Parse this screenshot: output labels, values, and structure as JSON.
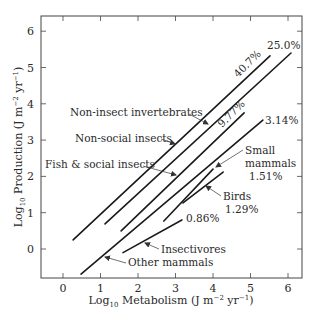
{
  "chart_data": {
    "type": "line",
    "title": "",
    "xlabel": "Log10 Metabolism (J m^-2 yr^-1)",
    "ylabel": "Log10 Production (J m^-2 yr^-1)",
    "xlabel_parts": {
      "log": "Log",
      "sub": "10",
      "main": " Metabolism (J m",
      "exp1": "−2",
      "mid": " yr",
      "exp2": "−1",
      "end": ")"
    },
    "ylabel_parts": {
      "log": "Log",
      "sub": "10",
      "main": " Production (J m",
      "exp1": "−2",
      "mid": " yr",
      "exp2": "−1",
      "end": ")"
    },
    "xlim": [
      -0.6,
      6.3
    ],
    "ylim": [
      -0.8,
      6.4
    ],
    "xticks": [
      0,
      1,
      2,
      3,
      4,
      5,
      6
    ],
    "yticks": [
      0,
      1,
      2,
      3,
      4,
      5,
      6
    ],
    "grid": false,
    "legend": "none (direct labels)",
    "series": [
      {
        "name": "Non-social insects",
        "efficiency": "40.7%",
        "x": [
          0.27,
          5.52
        ],
        "y": [
          0.25,
          5.32
        ]
      },
      {
        "name": "Non-insect invertebrates",
        "efficiency": "25.0%",
        "x": [
          1.12,
          6.08
        ],
        "y": [
          0.69,
          5.4
        ]
      },
      {
        "name": "Fish & social insects",
        "efficiency": "9.77%",
        "x": [
          1.55,
          4.83
        ],
        "y": [
          0.5,
          3.75
        ]
      },
      {
        "name": "Other mammals",
        "efficiency": "3.14%",
        "x": [
          0.48,
          5.33
        ],
        "y": [
          -0.69,
          3.55
        ]
      },
      {
        "name": "Small mammals",
        "efficiency": "1.51%",
        "x": [
          2.69,
          4.0
        ],
        "y": [
          0.77,
          2.2
        ]
      },
      {
        "name": "Birds",
        "efficiency": "1.29%",
        "x": [
          3.2,
          4.27
        ],
        "y": [
          1.27,
          2.12
        ]
      },
      {
        "name": "Insectivores",
        "efficiency": "0.86%",
        "x": [
          1.6,
          3.17
        ],
        "y": [
          -0.1,
          0.8
        ]
      }
    ],
    "annotations": [
      {
        "text": "40.7%",
        "target": "Non-social insects"
      },
      {
        "text": "25.0%",
        "target": "Non-insect invertebrates"
      },
      {
        "text": "9.77%",
        "target": "Fish & social insects"
      },
      {
        "text": "3.14%",
        "target": "Other mammals"
      },
      {
        "text": "Small mammals 1.51%",
        "target": "Small mammals"
      },
      {
        "text": "Birds 1.29%",
        "target": "Birds"
      },
      {
        "text": "0.86%",
        "target": "Insectivores"
      },
      {
        "text": "Non-insect invertebrates",
        "target": "Non-insect invertebrates"
      },
      {
        "text": "Non-social insects",
        "target": "Non-social insects"
      },
      {
        "text": "Fish & social insects",
        "target": "Fish & social insects"
      },
      {
        "text": "Insectivores",
        "target": "Insectivores"
      },
      {
        "text": "Other mammals",
        "target": "Other mammals"
      }
    ]
  },
  "labels": {
    "tick_x": [
      "0",
      "1",
      "2",
      "3",
      "4",
      "5",
      "6"
    ],
    "tick_y": [
      "0",
      "1",
      "2",
      "3",
      "4",
      "5",
      "6"
    ],
    "pct_40": "40.7%",
    "pct_25": "25.0%",
    "pct_977": "9.77%",
    "pct_314": "3.14%",
    "pct_086": "0.86%",
    "small": "Small",
    "mammals": "mammals",
    "pct_151": "1.51%",
    "birds": "Birds",
    "pct_129": "1.29%",
    "non_insect_inv": "Non-insect invertebrates",
    "non_social": "Non-social insects",
    "fish_social": "Fish & social insects",
    "insectivores": "Insectivores",
    "other_mammals": "Other mammals"
  }
}
